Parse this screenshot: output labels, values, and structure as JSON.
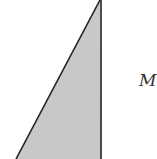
{
  "diagram": {
    "shape": "right-triangle",
    "fill_color": "#c8c8c8",
    "stroke_color": "#222222",
    "vertices": [
      [
        100,
        0
      ],
      [
        101,
        159
      ],
      [
        16,
        159
      ]
    ],
    "labels": [
      {
        "id": "side-label",
        "text": "M",
        "x": 139,
        "y": 72
      }
    ]
  }
}
